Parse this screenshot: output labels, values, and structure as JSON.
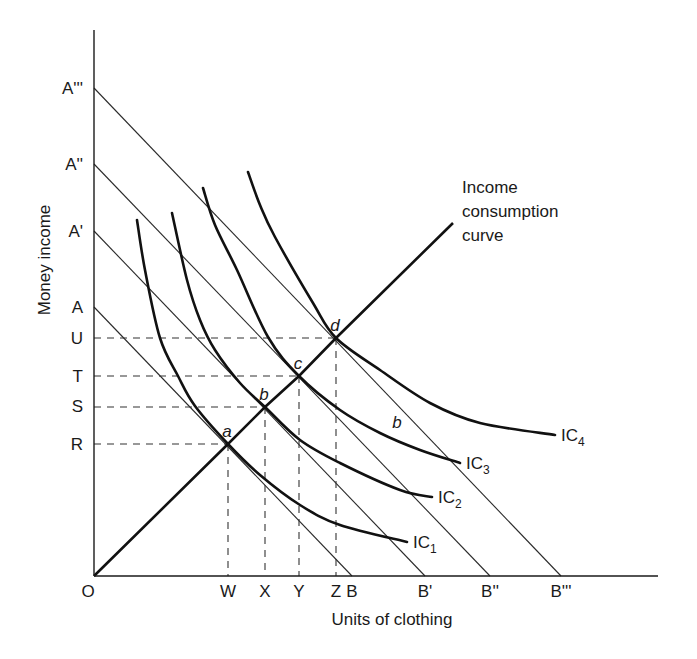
{
  "chart_data": {
    "type": "line",
    "title": "",
    "xlabel": "Units of clothing",
    "ylabel": "Money income",
    "xlim": [
      0,
      56.4
    ],
    "ylim": [
      0,
      54.6
    ],
    "grid": false,
    "origin_label": "O",
    "y_ticks": [
      {
        "label": "A'''",
        "value": 48.8
      },
      {
        "label": "A''",
        "value": 41.2
      },
      {
        "label": "A'",
        "value": 34.5
      },
      {
        "label": "A",
        "value": 26.9
      },
      {
        "label": "U",
        "value": 23.8
      },
      {
        "label": "T",
        "value": 20.0
      },
      {
        "label": "S",
        "value": 17.0
      },
      {
        "label": "R",
        "value": 13.2
      }
    ],
    "x_ticks": [
      {
        "label": "W",
        "value": 13.4
      },
      {
        "label": "X",
        "value": 17.1
      },
      {
        "label": "Y",
        "value": 20.5
      },
      {
        "label": "Z",
        "value": 24.2
      },
      {
        "label": "B",
        "value": 25.8
      },
      {
        "label": "B'",
        "value": 33.1
      },
      {
        "label": "B''",
        "value": 39.6
      },
      {
        "label": "B'''",
        "value": 46.7
      }
    ],
    "budget_lines": [
      {
        "name": "AB",
        "from": [
          0,
          26.9
        ],
        "to": [
          25.8,
          0
        ]
      },
      {
        "name": "A'B'",
        "from": [
          0,
          34.5
        ],
        "to": [
          33.1,
          0
        ]
      },
      {
        "name": "A''B''",
        "from": [
          0,
          41.2
        ],
        "to": [
          39.6,
          0
        ]
      },
      {
        "name": "A'''B'''",
        "from": [
          0,
          48.8
        ],
        "to": [
          46.7,
          0
        ]
      }
    ],
    "indifference_curves": [
      {
        "name": "IC",
        "sub": "1",
        "points": [
          [
            4.3,
            35.6
          ],
          [
            5.1,
            30.6
          ],
          [
            6.6,
            23.8
          ],
          [
            8.4,
            20.0
          ],
          [
            10.1,
            17.0
          ],
          [
            13.4,
            13.2
          ],
          [
            16.6,
            10.1
          ],
          [
            20.6,
            7.1
          ],
          [
            24.6,
            5.1
          ],
          [
            31.3,
            3.4
          ]
        ]
      },
      {
        "name": "IC",
        "sub": "2",
        "points": [
          [
            7.8,
            36.3
          ],
          [
            9.3,
            29.6
          ],
          [
            10.6,
            25.6
          ],
          [
            12.1,
            22.6
          ],
          [
            14.6,
            19.3
          ],
          [
            17.1,
            16.9
          ],
          [
            20.6,
            13.6
          ],
          [
            24.6,
            11.3
          ],
          [
            30.6,
            8.6
          ],
          [
            33.8,
            7.9
          ]
        ]
      },
      {
        "name": "IC",
        "sub": "3",
        "points": [
          [
            10.9,
            38.8
          ],
          [
            12.1,
            35.1
          ],
          [
            14.3,
            30.6
          ],
          [
            17.4,
            23.9
          ],
          [
            20.5,
            20.0
          ],
          [
            24.6,
            16.6
          ],
          [
            28.6,
            14.3
          ],
          [
            32.6,
            12.6
          ],
          [
            36.6,
            11.3
          ]
        ]
      },
      {
        "name": "IC",
        "sub": "4",
        "points": [
          [
            15.4,
            40.4
          ],
          [
            16.6,
            37.1
          ],
          [
            18.1,
            33.9
          ],
          [
            21.9,
            27.3
          ],
          [
            24.2,
            23.8
          ],
          [
            28.6,
            20.6
          ],
          [
            33.6,
            17.3
          ],
          [
            38.6,
            15.3
          ],
          [
            46.1,
            14.1
          ]
        ]
      }
    ],
    "income_consumption_curve": {
      "label_lines": [
        "Income",
        "consumption",
        "curve"
      ],
      "points": [
        [
          0,
          0
        ],
        [
          13.4,
          13.2
        ],
        [
          17.1,
          16.9
        ],
        [
          20.5,
          20.0
        ],
        [
          24.2,
          23.8
        ],
        [
          35.9,
          35.3
        ]
      ]
    },
    "equilibrium_points": [
      {
        "label": "a",
        "x": 13.4,
        "y": 13.2,
        "x_tick": "W",
        "y_tick": "R"
      },
      {
        "label": "b",
        "x": 17.1,
        "y": 16.9,
        "x_tick": "X",
        "y_tick": "S"
      },
      {
        "label": "c",
        "x": 20.5,
        "y": 20.0,
        "x_tick": "Y",
        "y_tick": "T"
      },
      {
        "label": "d",
        "x": 24.2,
        "y": 23.8,
        "x_tick": "Z",
        "y_tick": "U"
      }
    ],
    "annotations": [
      {
        "text": "b",
        "x": 30.3,
        "y": 15.4
      }
    ]
  }
}
